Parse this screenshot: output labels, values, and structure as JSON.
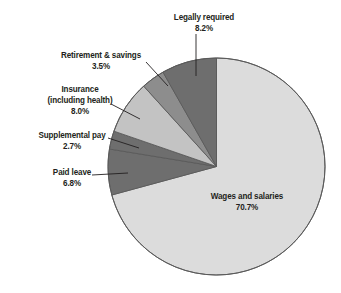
{
  "chart_data": {
    "type": "pie",
    "title": "",
    "subtitle": "",
    "xlabel": "",
    "ylabel": "",
    "legend_position": "none",
    "grid": false,
    "labels_shown_on_slices": true,
    "units": "percent",
    "total": 99.9,
    "start_angle_deg": 0,
    "direction": "clockwise",
    "categories": [
      "Wages and salaries",
      "Legally required",
      "Retirement & savings",
      "Insurance (including health)",
      "Supplemental pay",
      "Paid leave"
    ],
    "values": [
      70.7,
      8.2,
      3.5,
      8.0,
      2.7,
      6.8
    ],
    "value_labels": [
      "70.7%",
      "8.2%",
      "3.5%",
      "8.0%",
      "2.7%",
      "6.8%"
    ],
    "colors": [
      "#dcdcdc",
      "#6e6e6e",
      "#8d8d8d",
      "#c3c3c3",
      "#6e6e6e",
      "#6e6e6e"
    ],
    "slices": [
      {
        "name": "Wages and salaries",
        "label_line1": "Wages and salaries",
        "label_line2": "70.7%",
        "value": 70.7,
        "color": "#dcdcdc",
        "label_placement": "inside"
      },
      {
        "name": "Legally required",
        "label_line1": "Legally required",
        "label_line2": "8.2%",
        "value": 8.2,
        "color": "#6e6e6e",
        "label_placement": "outside-top"
      },
      {
        "name": "Retirement & savings",
        "label_line1": "Retirement & savings",
        "label_line2": "3.5%",
        "value": 3.5,
        "color": "#8d8d8d",
        "label_placement": "outside-left"
      },
      {
        "name": "Insurance (including health)",
        "label_line1": "Insurance",
        "label_line2": "(including health)",
        "label_line3": "8.0%",
        "value": 8.0,
        "color": "#c3c3c3",
        "label_placement": "outside-left"
      },
      {
        "name": "Supplemental pay",
        "label_line1": "Supplemental pay",
        "label_line2": "2.7%",
        "value": 2.7,
        "color": "#6e6e6e",
        "label_placement": "outside-left"
      },
      {
        "name": "Paid leave",
        "label_line1": "Paid leave",
        "label_line2": "6.8%",
        "value": 6.8,
        "color": "#6e6e6e",
        "label_placement": "outside-left"
      }
    ],
    "style": {
      "background": "#ffffff",
      "outline": "#5a5a5a",
      "text": "#231f20"
    }
  }
}
